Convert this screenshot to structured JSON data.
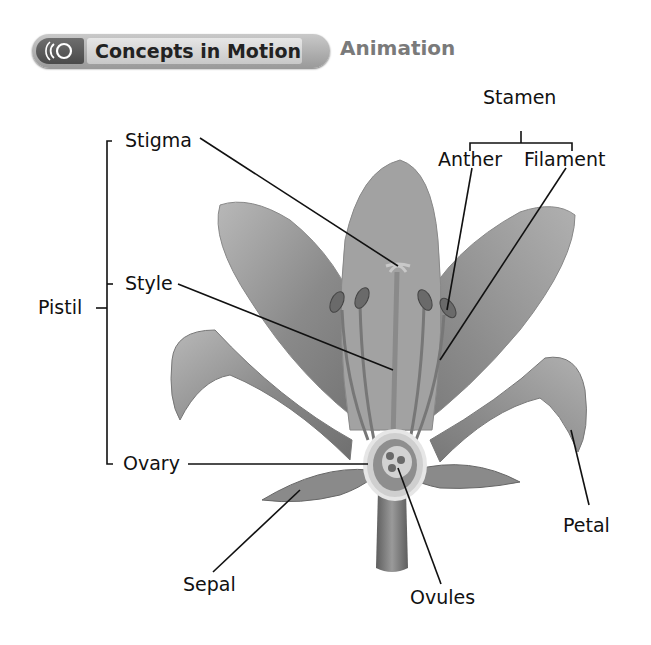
{
  "banner": {
    "title": "Concepts in Motion",
    "subtitle": "Animation",
    "icon": "motion-waves-icon"
  },
  "diagram": {
    "labels": {
      "stamen": "Stamen",
      "anther": "Anther",
      "filament": "Filament",
      "stigma": "Stigma",
      "style": "Style",
      "pistil": "Pistil",
      "ovary": "Ovary",
      "sepal": "Sepal",
      "ovules": "Ovules",
      "petal": "Petal"
    },
    "colors": {
      "petal": "#8f8f8f",
      "petal_light": "#b5b5b5",
      "stem": "#7a7a7a",
      "leader_line": "#111111"
    }
  }
}
